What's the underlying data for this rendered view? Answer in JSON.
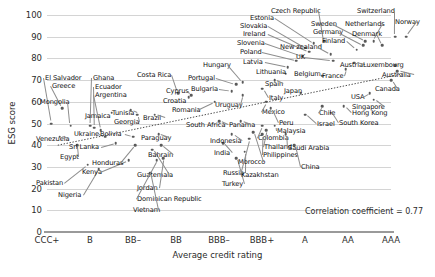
{
  "chart_data": {
    "type": "scatter",
    "title": "",
    "xlabel": "Average credit rating",
    "ylabel": "ESG score",
    "ylim": [
      0,
      100
    ],
    "yticks": [
      0,
      10,
      20,
      30,
      40,
      50,
      60,
      70,
      80,
      90,
      100
    ],
    "xticks": [
      "CCC+",
      "B",
      "BB–",
      "BB",
      "BBB–",
      "BBB+",
      "A",
      "AA",
      "AAA"
    ],
    "grid": true,
    "legend": "none",
    "annotation": "Correlation coefficient = 0.77",
    "correlation": 0.77,
    "trendline": {
      "type": "linear-dotted",
      "x0": 0.25,
      "y0": 40,
      "x1": 8.3,
      "y1": 73
    },
    "points": [
      {
        "label": "El Salvador",
        "x": 0.1,
        "y": 50,
        "lx": 45,
        "ly": 75
      },
      {
        "label": "Greece",
        "x": 0.35,
        "y": 57,
        "lx": 52,
        "ly": 83
      },
      {
        "label": "Mongolia",
        "x": 0.55,
        "y": 49,
        "lx": 40,
        "ly": 99
      },
      {
        "label": "Venezuela",
        "x": 0.3,
        "y": 44,
        "lx": 36,
        "ly": 136
      },
      {
        "label": "Egypt",
        "x": 0.7,
        "y": 40,
        "lx": 60,
        "ly": 154
      },
      {
        "label": "Pakistan",
        "x": 0.95,
        "y": 31,
        "lx": 36,
        "ly": 180
      },
      {
        "label": "Nigeria",
        "x": 1.2,
        "y": 29,
        "lx": 58,
        "ly": 192
      },
      {
        "label": "Ghana",
        "x": 1.0,
        "y": 49,
        "lx": 93,
        "ly": 75
      },
      {
        "label": "Ecuador",
        "x": 1.1,
        "y": 48,
        "lx": 95,
        "ly": 84
      },
      {
        "label": "Argentina",
        "x": 1.25,
        "y": 47,
        "lx": 95,
        "ly": 92
      },
      {
        "label": "Jamaica",
        "x": 1.5,
        "y": 55,
        "lx": 85,
        "ly": 113
      },
      {
        "label": "Ukraine",
        "x": 1.35,
        "y": 44,
        "lx": 74,
        "ly": 131
      },
      {
        "label": "Sri Lanka",
        "x": 1.6,
        "y": 41,
        "lx": 69,
        "ly": 144
      },
      {
        "label": "Kenya",
        "x": 1.9,
        "y": 33,
        "lx": 82,
        "ly": 169
      },
      {
        "label": "Honduras",
        "x": 2.05,
        "y": 40,
        "lx": 92,
        "ly": 160
      },
      {
        "label": "Tunisia",
        "x": 1.95,
        "y": 56,
        "lx": 112,
        "ly": 110
      },
      {
        "label": "Georgia",
        "x": 2.1,
        "y": 54,
        "lx": 114,
        "ly": 119
      },
      {
        "label": "Bolivia",
        "x": 2.0,
        "y": 44,
        "lx": 100,
        "ly": 131
      },
      {
        "label": "Brazil",
        "x": 2.5,
        "y": 54,
        "lx": 143,
        "ly": 115
      },
      {
        "label": "Paraguay",
        "x": 2.6,
        "y": 45,
        "lx": 141,
        "ly": 135
      },
      {
        "label": "Guatemala",
        "x": 2.45,
        "y": 38,
        "lx": 137,
        "ly": 172
      },
      {
        "label": "Bahrain",
        "x": 2.65,
        "y": 40,
        "lx": 148,
        "ly": 152
      },
      {
        "label": "Jordan",
        "x": 2.7,
        "y": 34,
        "lx": 137,
        "ly": 185
      },
      {
        "label": "Dominican Republic",
        "x": 2.55,
        "y": 33,
        "lx": 137,
        "ly": 196
      },
      {
        "label": "Vietnam",
        "x": 2.4,
        "y": 27,
        "lx": 133,
        "ly": 207
      },
      {
        "label": "Costa Rica",
        "x": 3.05,
        "y": 64,
        "lx": 137,
        "ly": 72
      },
      {
        "label": "Cyprus",
        "x": 3.35,
        "y": 63,
        "lx": 166,
        "ly": 88
      },
      {
        "label": "Croatia",
        "x": 3.3,
        "y": 62,
        "lx": 163,
        "ly": 98
      },
      {
        "label": "Romania",
        "x": 3.9,
        "y": 60,
        "lx": 172,
        "ly": 107
      },
      {
        "label": "Portugal",
        "x": 4.4,
        "y": 68,
        "lx": 188,
        "ly": 75
      },
      {
        "label": "Bulgaria",
        "x": 4.3,
        "y": 65,
        "lx": 191,
        "ly": 86
      },
      {
        "label": "Hungary",
        "x": 4.55,
        "y": 69,
        "lx": 203,
        "ly": 62
      },
      {
        "label": "Uruguay",
        "x": 4.55,
        "y": 63,
        "lx": 215,
        "ly": 102
      },
      {
        "label": "South Africa",
        "x": 4.0,
        "y": 51,
        "lx": 186,
        "ly": 122
      },
      {
        "label": "Panama",
        "x": 4.5,
        "y": 51,
        "lx": 229,
        "ly": 122
      },
      {
        "label": "Indonesia",
        "x": 4.3,
        "y": 45,
        "lx": 210,
        "ly": 138
      },
      {
        "label": "India",
        "x": 4.1,
        "y": 41,
        "lx": 214,
        "ly": 150
      },
      {
        "label": "Russia",
        "x": 4.6,
        "y": 37,
        "lx": 223,
        "ly": 170
      },
      {
        "label": "Turkey",
        "x": 4.4,
        "y": 34,
        "lx": 222,
        "ly": 181
      },
      {
        "label": "Morocco",
        "x": 4.8,
        "y": 46,
        "lx": 238,
        "ly": 159
      },
      {
        "label": "Kazakhstan",
        "x": 4.7,
        "y": 43,
        "lx": 241,
        "ly": 172
      },
      {
        "label": "Colombia",
        "x": 5.0,
        "y": 49,
        "lx": 258,
        "ly": 135
      },
      {
        "label": "Thailand",
        "x": 5.1,
        "y": 47,
        "lx": 264,
        "ly": 144
      },
      {
        "label": "Philippines",
        "x": 5.0,
        "y": 45,
        "lx": 263,
        "ly": 152
      },
      {
        "label": "Malaysia",
        "x": 5.3,
        "y": 49,
        "lx": 277,
        "ly": 128
      },
      {
        "label": "Saudi Arabia",
        "x": 5.55,
        "y": 45,
        "lx": 288,
        "ly": 145
      },
      {
        "label": "China",
        "x": 5.75,
        "y": 40,
        "lx": 301,
        "ly": 164
      },
      {
        "label": "Mexico",
        "x": 5.1,
        "y": 60,
        "lx": 262,
        "ly": 109
      },
      {
        "label": "Peru",
        "x": 5.2,
        "y": 57,
        "lx": 279,
        "ly": 120
      },
      {
        "label": "Italy",
        "x": 5.0,
        "y": 66,
        "lx": 269,
        "ly": 95
      },
      {
        "label": "Spain",
        "x": 5.3,
        "y": 70,
        "lx": 265,
        "ly": 81
      },
      {
        "label": "Lithuania",
        "x": 5.55,
        "y": 73,
        "lx": 256,
        "ly": 69
      },
      {
        "label": "Latvia",
        "x": 5.6,
        "y": 76,
        "lx": 243,
        "ly": 59
      },
      {
        "label": "Poland",
        "x": 5.8,
        "y": 79,
        "lx": 240,
        "ly": 49
      },
      {
        "label": "Slovenia",
        "x": 5.95,
        "y": 81,
        "lx": 237,
        "ly": 40
      },
      {
        "label": "Ireland",
        "x": 6.1,
        "y": 83,
        "lx": 243,
        "ly": 31
      },
      {
        "label": "Slovakia",
        "x": 6.0,
        "y": 85,
        "lx": 240,
        "ly": 23
      },
      {
        "label": "Estonia",
        "x": 6.2,
        "y": 87,
        "lx": 250,
        "ly": 15
      },
      {
        "label": "Czech Republic",
        "x": 6.45,
        "y": 88,
        "lx": 271,
        "ly": 8
      },
      {
        "label": "Japan",
        "x": 5.9,
        "y": 64,
        "lx": 284,
        "ly": 88
      },
      {
        "label": "Israel",
        "x": 6.0,
        "y": 54,
        "lx": 317,
        "ly": 121
      },
      {
        "label": "Chile",
        "x": 6.4,
        "y": 58,
        "lx": 319,
        "ly": 110
      },
      {
        "label": "Hong Kong",
        "x": 6.9,
        "y": 58,
        "lx": 352,
        "ly": 110
      },
      {
        "label": "South Korea",
        "x": 6.6,
        "y": 55,
        "lx": 339,
        "ly": 120
      },
      {
        "label": "Belgium",
        "x": 6.4,
        "y": 72,
        "lx": 294,
        "ly": 71
      },
      {
        "label": "UK",
        "x": 6.65,
        "y": 79,
        "lx": 296,
        "ly": 54
      },
      {
        "label": "New zealand",
        "x": 6.6,
        "y": 82,
        "lx": 280,
        "ly": 44
      },
      {
        "label": "France",
        "x": 6.95,
        "y": 75,
        "lx": 322,
        "ly": 73
      },
      {
        "label": "Austria",
        "x": 7.15,
        "y": 78,
        "lx": 340,
        "ly": 62
      },
      {
        "label": "Finland",
        "x": 7.2,
        "y": 84,
        "lx": 322,
        "ly": 38
      },
      {
        "label": "Germany",
        "x": 7.35,
        "y": 86,
        "lx": 313,
        "ly": 29
      },
      {
        "label": "Sweden",
        "x": 7.4,
        "y": 88,
        "lx": 311,
        "ly": 21
      },
      {
        "label": "Netherlands",
        "x": 7.6,
        "y": 88,
        "lx": 345,
        "ly": 21
      },
      {
        "label": "Denmark",
        "x": 7.8,
        "y": 86,
        "lx": 352,
        "ly": 31
      },
      {
        "label": "Switzerland",
        "x": 8.1,
        "y": 90,
        "lx": 357,
        "ly": 8
      },
      {
        "label": "Norway",
        "x": 8.35,
        "y": 90,
        "lx": 395,
        "ly": 19
      },
      {
        "label": "Luxembourg",
        "x": 8.1,
        "y": 77,
        "lx": 363,
        "ly": 62
      },
      {
        "label": "Australia",
        "x": 8.15,
        "y": 74,
        "lx": 382,
        "ly": 72
      },
      {
        "label": "Canada",
        "x": 8.0,
        "y": 70,
        "lx": 375,
        "ly": 86
      },
      {
        "label": "USA",
        "x": 7.5,
        "y": 64,
        "lx": 351,
        "ly": 94
      },
      {
        "label": "Singapore",
        "x": 7.6,
        "y": 61,
        "lx": 352,
        "ly": 104
      }
    ]
  }
}
